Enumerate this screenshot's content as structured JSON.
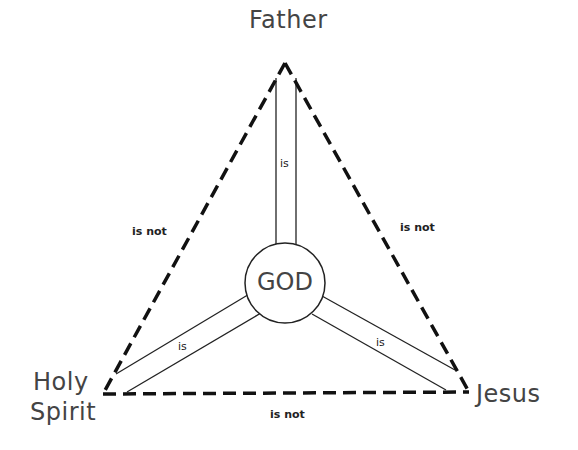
{
  "diagram": {
    "type": "Shield of the Trinity",
    "center": {
      "label": "GOD"
    },
    "vertices": {
      "top": {
        "label": "Father"
      },
      "bottom_left": {
        "label_line1": "Holy",
        "label_line2": "Spirit"
      },
      "bottom_right": {
        "label": "Jesus"
      }
    },
    "edges": {
      "left": {
        "label": "is not",
        "style": "dashed"
      },
      "right": {
        "label": "is not",
        "style": "dashed"
      },
      "bottom": {
        "label": "is not",
        "style": "dashed"
      }
    },
    "spokes": {
      "top": {
        "label": "is"
      },
      "bottom_left": {
        "label": "is"
      },
      "bottom_right": {
        "label": "is"
      }
    },
    "colors": {
      "line": "#111111",
      "text": "#444444",
      "background": "#ffffff"
    }
  }
}
